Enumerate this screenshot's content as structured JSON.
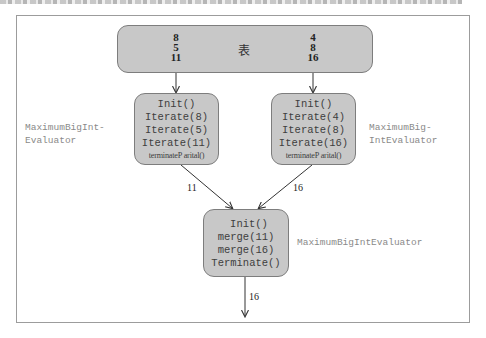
{
  "source_table": {
    "label": "表",
    "left_column": [
      "8",
      "5",
      "11"
    ],
    "right_column": [
      "4",
      "8",
      "16"
    ]
  },
  "evaluator_left": {
    "calls": [
      "Init()",
      "Iterate(8)",
      "Iterate(5)",
      "Iterate(11)",
      "terminateP arital()"
    ],
    "side_label": [
      "MaximumBigInt-",
      "Evaluator"
    ]
  },
  "evaluator_right": {
    "calls": [
      "Init()",
      "Iterate(4)",
      "Iterate(8)",
      "Iterate(16)",
      "terminateP arital()"
    ],
    "side_label": [
      "MaximumBig-",
      "IntEvaluator"
    ]
  },
  "evaluator_merge": {
    "calls": [
      "Init()",
      "merge(11)",
      "merge(16)",
      "Terminate()"
    ],
    "side_label": "MaximumBigIntEvaluator"
  },
  "edges": {
    "left_to_merge": "11",
    "right_to_merge": "16",
    "merge_output": "16"
  },
  "colors": {
    "node_fill": "#c8c8c8",
    "node_border": "#7d7d7d",
    "frame_border": "#9c9c9c",
    "side_label_text": "#8a8a8a",
    "edge_stroke": "#333333"
  }
}
